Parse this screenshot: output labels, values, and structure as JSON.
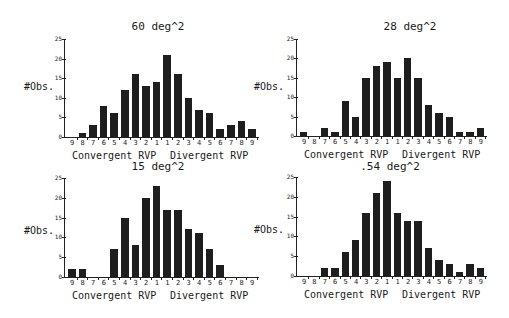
{
  "chart_data": [
    {
      "type": "bar",
      "title": "60 deg^2",
      "ylabel": "#Obs.",
      "xlabel_left": "Convergent RVP",
      "xlabel_right": "Divergent RVP",
      "categories": [
        "9",
        "8",
        "7",
        "6",
        "5",
        "4",
        "3",
        "2",
        "1",
        "1",
        "2",
        "3",
        "4",
        "5",
        "6",
        "7",
        "8",
        "9"
      ],
      "values": [
        0,
        1,
        3,
        8,
        6,
        12,
        16,
        13,
        14,
        21,
        16,
        10,
        7,
        6,
        2,
        3,
        4,
        2
      ],
      "yticks": [
        "0",
        "5",
        "10",
        "15",
        "20",
        "25"
      ],
      "ylim": [
        0,
        25
      ],
      "grid": false
    },
    {
      "type": "bar",
      "title": "28 deg^2",
      "ylabel": "#Obs.",
      "xlabel_left": "Convergent RVP",
      "xlabel_right": "Divergent RVP",
      "categories": [
        "9",
        "8",
        "7",
        "6",
        "5",
        "4",
        "3",
        "2",
        "1",
        "1",
        "2",
        "3",
        "4",
        "5",
        "6",
        "7",
        "8",
        "9"
      ],
      "values": [
        1,
        0,
        2,
        1,
        9,
        5,
        15,
        18,
        19,
        15,
        20,
        15,
        8,
        6,
        5,
        1,
        1,
        2
      ],
      "yticks": [
        "0",
        "5",
        "10",
        "15",
        "20",
        "25"
      ],
      "ylim": [
        0,
        25
      ],
      "grid": false
    },
    {
      "type": "bar",
      "title": "15 deg^2",
      "ylabel": "#Obs.",
      "xlabel_left": "Convergent RVP",
      "xlabel_right": "Divergent RVP",
      "categories": [
        "9",
        "8",
        "7",
        "6",
        "5",
        "4",
        "3",
        "2",
        "1",
        "1",
        "2",
        "3",
        "4",
        "5",
        "6",
        "7",
        "8",
        "9"
      ],
      "values": [
        2,
        2,
        0,
        0,
        7,
        15,
        8,
        20,
        23,
        17,
        17,
        12,
        11,
        7,
        3,
        0,
        0,
        0
      ],
      "yticks": [
        "0",
        "5",
        "10",
        "15",
        "20",
        "25"
      ],
      "ylim": [
        0,
        25
      ],
      "grid": false
    },
    {
      "type": "bar",
      "title": ".54 deg^2",
      "ylabel": "#Obs.",
      "xlabel_left": "Convergent RVP",
      "xlabel_right": "Divergent RVP",
      "categories": [
        "9",
        "8",
        "7",
        "6",
        "5",
        "4",
        "3",
        "2",
        "1",
        "1",
        "2",
        "3",
        "4",
        "5",
        "6",
        "7",
        "8",
        "9"
      ],
      "values": [
        0,
        0,
        2,
        2,
        6,
        9,
        16,
        21,
        24,
        16,
        14,
        14,
        7,
        4,
        3,
        1,
        3,
        2
      ],
      "yticks": [
        "0",
        "5",
        "10",
        "15",
        "20",
        "25"
      ],
      "ylim": [
        0,
        25
      ],
      "grid": false
    }
  ],
  "layout": [
    {
      "ox": 64,
      "base": 137,
      "top": 39,
      "step": 10.6,
      "titleX": 158,
      "titleY": 20,
      "ylabX": 24,
      "ylabY": 81,
      "xlabX": 72,
      "xlabY": 150
    },
    {
      "ox": 296,
      "base": 136,
      "top": 39,
      "step": 10.4,
      "titleX": 410,
      "titleY": 20,
      "ylabX": 254,
      "ylabY": 81,
      "xlabX": 304,
      "xlabY": 149
    },
    {
      "ox": 64,
      "base": 277,
      "top": 178,
      "step": 10.6,
      "titleX": 158,
      "titleY": 160,
      "ylabX": 24,
      "ylabY": 225,
      "xlabX": 72,
      "xlabY": 290
    },
    {
      "ox": 296,
      "base": 276,
      "top": 177,
      "step": 10.4,
      "titleX": 390,
      "titleY": 160,
      "ylabX": 254,
      "ylabY": 224,
      "xlabX": 304,
      "xlabY": 289
    }
  ]
}
